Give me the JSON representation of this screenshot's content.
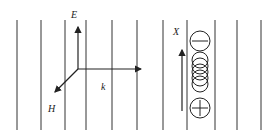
{
  "diagram": {
    "labels": {
      "E": "E",
      "H": "H",
      "k": "k",
      "X": "X"
    },
    "vertical_lines_x": [
      17,
      41,
      65,
      86,
      112,
      137,
      163,
      187,
      215,
      237,
      261
    ],
    "colors": {
      "line": "#333333",
      "background": "#ffffff"
    },
    "charges": {
      "top": "minus",
      "bottom": "plus"
    }
  }
}
